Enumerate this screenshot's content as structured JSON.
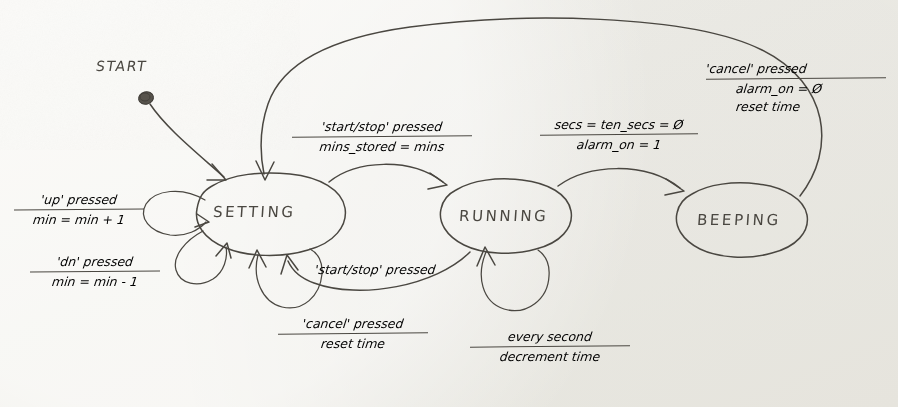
{
  "diagram": {
    "kind": "hand-drawn finite state machine",
    "medium_colors": {
      "paper": "#f1f0ea",
      "ink": "#4a4741"
    },
    "start": {
      "label": "START"
    },
    "states": [
      {
        "id": "setting",
        "label": "SETTING"
      },
      {
        "id": "running",
        "label": "RUNNING"
      },
      {
        "id": "beeping",
        "label": "BEEPING"
      }
    ],
    "transitions": [
      {
        "id": "up",
        "from": "setting",
        "to": "setting",
        "guard": "'up' pressed",
        "action": "min = min + 1"
      },
      {
        "id": "dn",
        "from": "setting",
        "to": "setting",
        "guard": "'dn' pressed",
        "action": "min = min - 1"
      },
      {
        "id": "setting-to-running",
        "from": "setting",
        "to": "running",
        "guard": "'start/stop' pressed",
        "action": "mins_stored = mins"
      },
      {
        "id": "running-to-beeping",
        "from": "running",
        "to": "beeping",
        "guard": "secs = ten_secs = Ø",
        "action": "alarm_on = 1"
      },
      {
        "id": "beeping-to-setting",
        "from": "beeping",
        "to": "setting",
        "guard": "'cancel' pressed",
        "action": "alarm_on = Ø",
        "action2": "reset time"
      },
      {
        "id": "running-to-setting",
        "from": "running",
        "to": "setting",
        "guard": "'start/stop' pressed",
        "action": ""
      },
      {
        "id": "setting-cancel",
        "from": "setting",
        "to": "setting",
        "guard": "'cancel' pressed",
        "action": "reset time"
      },
      {
        "id": "running-tick",
        "from": "running",
        "to": "running",
        "guard": "every second",
        "action": "decrement time"
      }
    ]
  }
}
